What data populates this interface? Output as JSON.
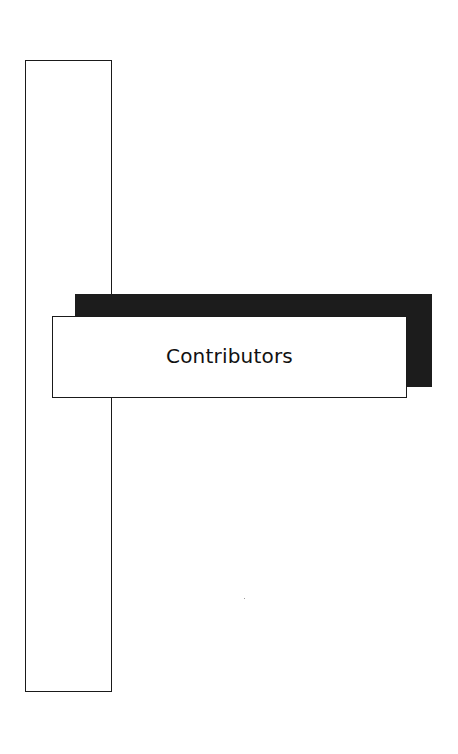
{
  "page": {
    "title": "Contributors"
  },
  "colors": {
    "background": "#ffffff",
    "border": "#1a1a1a",
    "shadow": "#1c1c1c"
  }
}
